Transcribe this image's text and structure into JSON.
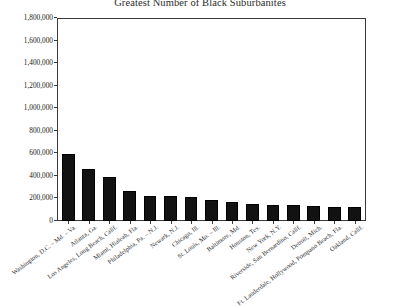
{
  "chart_data": {
    "type": "bar",
    "title": "Greatest Number of Black Suburbanites",
    "subtitle": "",
    "xlabel": "",
    "ylabel": "",
    "ylim": [
      0,
      1800000
    ],
    "grid": false,
    "legend": "none",
    "ytick_labels": [
      "1,800,000",
      "1,600,000",
      "1,400,000",
      "1,200,000",
      "1,000,000",
      "800,000",
      "600,000",
      "400,000",
      "200,000",
      "0"
    ],
    "ytick_values": [
      1800000,
      1600000,
      1400000,
      1200000,
      1000000,
      800000,
      600000,
      400000,
      200000,
      0
    ],
    "categories": [
      "Washington, D.C. – Md. – Va.",
      "Atlanta, Ga.",
      "Los Angeles, Long Beach, Calif.",
      "Miami, Hialeah, Fla.",
      "Philadelphia, Pa. – N.J.",
      "Newark, N.J.",
      "Chicago, Ill.",
      "St. Louis, Mo. – Ill.",
      "Baltimore, Md.",
      "Houston, Tex.",
      "New York, N.Y.",
      "Riverside, San Bernardino, Calif.",
      "Detroit, Mich.",
      "Ft. Lauderdale, Hollywood, Pompano Beach, Fla.",
      "Oakland, Calif."
    ],
    "values": [
      600000,
      465000,
      390000,
      270000,
      225000,
      225000,
      215000,
      185000,
      170000,
      150000,
      145000,
      140000,
      130000,
      125000,
      125000
    ]
  },
  "caption": {
    "text": ""
  }
}
